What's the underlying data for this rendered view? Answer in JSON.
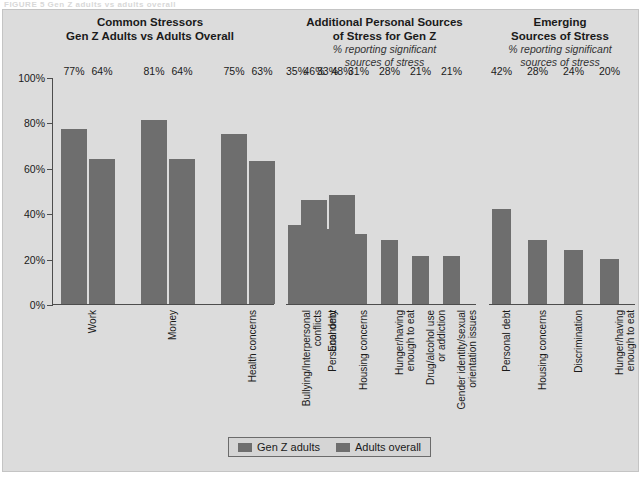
{
  "figure": {
    "caption_fragment": "FIGURE 5   Gen Z adults vs adults overall"
  },
  "colors": {
    "panel_background": "#dcdcdc",
    "bar_genz": "#6e6e6e",
    "bar_overall": "#6e6e6e",
    "axis": "#4d4d4d",
    "text": "#1a1a1a"
  },
  "legend": {
    "items": [
      {
        "label": "Gen Z adults",
        "color": "#6e6e6e"
      },
      {
        "label": "Adults overall",
        "color": "#6e6e6e"
      }
    ]
  },
  "panels": [
    {
      "id": "common-stressors",
      "title_line1": "Common Stressors",
      "title_line2": "Gen Z Adults vs Adults Overall",
      "subtitle": ""
    },
    {
      "id": "additional-personal-sources",
      "title_line1": "Additional Personal Sources",
      "title_line2": "of Stress for Gen Z",
      "subtitle_line1": "% reporting significant",
      "subtitle_line2": "sources of stress"
    },
    {
      "id": "emerging-sources",
      "title_line1": "Emerging",
      "title_line2": "Sources of Stress",
      "subtitle_line1": "% reporting significant",
      "subtitle_line2": "sources of stress"
    }
  ],
  "chart_data": [
    {
      "type": "bar",
      "id": "common-stressors",
      "title": "Common Stressors — Gen Z Adults vs Adults Overall",
      "xlabel": "",
      "ylabel": "",
      "ylim": [
        0,
        100
      ],
      "ytick_labels": [
        "0%",
        "20%",
        "40%",
        "60%",
        "80%",
        "100%"
      ],
      "ytick_values": [
        0,
        20,
        40,
        60,
        80,
        100
      ],
      "grid": false,
      "legend_position": "bottom-center",
      "categories": [
        "Work",
        "Money",
        "Health concerns",
        "Economy"
      ],
      "category_lines": [
        [
          "Work"
        ],
        [
          "Money"
        ],
        [
          "Health concerns"
        ],
        [
          "Economy"
        ]
      ],
      "series": [
        {
          "name": "Gen Z adults",
          "values": [
            77,
            81,
            75,
            46
          ],
          "labels": [
            "77%",
            "81%",
            "75%",
            "46%"
          ]
        },
        {
          "name": "Adults overall",
          "values": [
            64,
            64,
            63,
            48
          ],
          "labels": [
            "64%",
            "64%",
            "63%",
            "48%"
          ]
        }
      ]
    },
    {
      "type": "bar",
      "id": "additional-personal-sources",
      "title": "Additional Personal Sources of Stress for Gen Z",
      "subtitle": "% reporting significant sources of stress",
      "xlabel": "",
      "ylabel": "",
      "ylim": [
        0,
        100
      ],
      "grid": false,
      "categories": [
        "Bullying/Interpersonal conflicts",
        "Personal debt",
        "Housing concerns",
        "Hunger/having enough to eat",
        "Drug/alcohol use or addiction",
        "Gender identity/sexual orientation issues"
      ],
      "category_lines": [
        [
          "Bullying/Interpersonal",
          "conflicts"
        ],
        [
          "Personal debt"
        ],
        [
          "Housing concerns"
        ],
        [
          "Hunger/having",
          "enough to eat"
        ],
        [
          "Drug/alcohol use",
          "or addiction"
        ],
        [
          "Gender identity/sexual",
          "orientation issues"
        ]
      ],
      "series": [
        {
          "name": "Gen Z adults",
          "values": [
            35,
            33,
            31,
            28,
            21,
            21
          ],
          "labels": [
            "35%",
            "33%",
            "31%",
            "28%",
            "21%",
            "21%"
          ]
        }
      ]
    },
    {
      "type": "bar",
      "id": "emerging-sources",
      "title": "Emerging Sources of Stress",
      "subtitle": "% reporting significant sources of stress",
      "xlabel": "",
      "ylabel": "",
      "ylim": [
        0,
        100
      ],
      "grid": false,
      "categories": [
        "Personal debt",
        "Housing concerns",
        "Discrimination",
        "Hunger/having enough to eat"
      ],
      "category_lines": [
        [
          "Personal debt"
        ],
        [
          "Housing concerns"
        ],
        [
          "Discrimination"
        ],
        [
          "Hunger/having",
          "enough to eat"
        ]
      ],
      "series": [
        {
          "name": "Gen Z adults",
          "values": [
            42,
            28,
            24,
            20
          ],
          "labels": [
            "42%",
            "28%",
            "24%",
            "20%"
          ]
        }
      ]
    }
  ]
}
